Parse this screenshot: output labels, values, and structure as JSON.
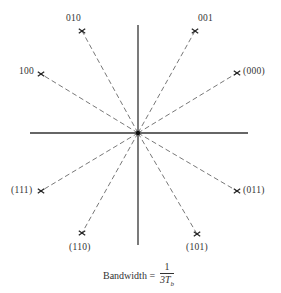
{
  "diagram": {
    "type": "8-PSK signal constellation",
    "center": [
      138,
      133
    ],
    "axes": {
      "horizontal": {
        "x1": 30,
        "x2": 248,
        "y": 133
      },
      "vertical": {
        "x": 138,
        "y1": 25,
        "y2": 245
      }
    },
    "points": [
      {
        "label": "010",
        "x": 82,
        "y": 31,
        "label_x": 66,
        "label_y": 14
      },
      {
        "label": "001",
        "x": 195,
        "y": 31,
        "label_x": 198,
        "label_y": 14
      },
      {
        "label": "100",
        "x": 41,
        "y": 74,
        "label_x": 19,
        "label_y": 67
      },
      {
        "label": "(000)",
        "x": 237,
        "y": 73,
        "label_x": 243,
        "label_y": 67
      },
      {
        "label": "(111)",
        "x": 41,
        "y": 191,
        "label_x": 11,
        "label_y": 186
      },
      {
        "label": "(011)",
        "x": 237,
        "y": 191,
        "label_x": 243,
        "label_y": 186
      },
      {
        "label": "(110)",
        "x": 82,
        "y": 233,
        "label_x": 69,
        "label_y": 243
      },
      {
        "label": "(101)",
        "x": 197,
        "y": 234,
        "label_x": 186,
        "label_y": 243
      }
    ],
    "caption": {
      "prefix": "Bandwidth =",
      "numerator": "1",
      "denominator_main": "3T",
      "denominator_sub": "b"
    },
    "colors": {
      "axis": "#333333",
      "dash": "#555555",
      "marker": "#222222"
    }
  }
}
